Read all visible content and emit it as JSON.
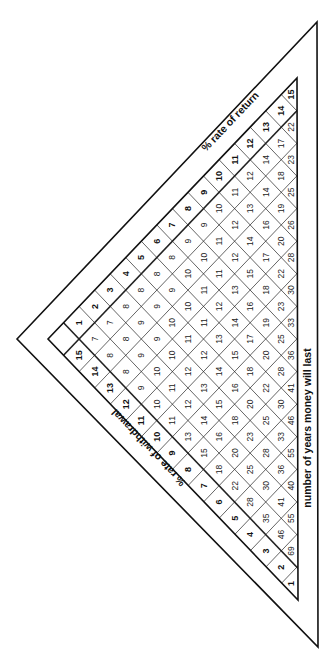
{
  "labels": {
    "rate_of_return": "% rate of return",
    "rate_of_withdrawal": "% rate of withdrawal",
    "years": "number of years money will last"
  },
  "return_rates": [
    1,
    2,
    3,
    4,
    5,
    6,
    7,
    8,
    9,
    10,
    11,
    12,
    13,
    14,
    15
  ],
  "withdrawal_rates": [
    15,
    14,
    13,
    12,
    11,
    10,
    9,
    8,
    7,
    6,
    5,
    4,
    3,
    2,
    1
  ],
  "years_table": {
    "note": "rows keyed by withdrawal rate; values listed for return rate 1..(w-1)",
    "2": [
      69
    ],
    "3": [
      46,
      55
    ],
    "4": [
      35,
      41,
      40
    ],
    "5": [
      28,
      30,
      36,
      55
    ],
    "6": [
      22,
      25,
      28,
      33,
      46
    ],
    "7": [
      18,
      20,
      23,
      25,
      30,
      41
    ],
    "8": [
      15,
      16,
      18,
      20,
      22,
      28,
      36
    ],
    "9": [
      13,
      14,
      15,
      16,
      18,
      20,
      25,
      33
    ],
    "10": [
      11,
      12,
      13,
      14,
      15,
      17,
      19,
      23,
      30
    ],
    "11": [
      10,
      11,
      12,
      12,
      13,
      14,
      16,
      18,
      22,
      28
    ],
    "12": [
      9,
      10,
      10,
      11,
      11,
      12,
      13,
      15,
      17,
      20,
      26
    ],
    "13": [
      8,
      9,
      9,
      10,
      10,
      11,
      11,
      12,
      14,
      16,
      19,
      25
    ],
    "14": [
      8,
      8,
      9,
      9,
      9,
      10,
      10,
      11,
      12,
      13,
      14,
      18,
      23
    ],
    "15": [
      7,
      7,
      8,
      8,
      8,
      8,
      9,
      9,
      10,
      11,
      12,
      14,
      17,
      22
    ]
  },
  "right_edge_values": [
    20,
    21,
    22,
    23,
    25,
    26,
    28,
    30,
    33,
    36,
    41,
    46,
    55,
    69
  ]
}
